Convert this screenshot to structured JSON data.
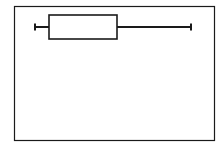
{
  "chart_data": {
    "type": "box",
    "title": "",
    "xlabel": "",
    "ylabel": "",
    "orientation": "horizontal",
    "xlim": [
      0,
      100
    ],
    "grid": false,
    "legend": null,
    "series": [
      {
        "name": "",
        "min": 10.5,
        "q1": 17.5,
        "q3": 51.5,
        "max": 88.5
      }
    ]
  },
  "style": {
    "stroke": "#1a1a1a",
    "background": "#ffffff"
  }
}
